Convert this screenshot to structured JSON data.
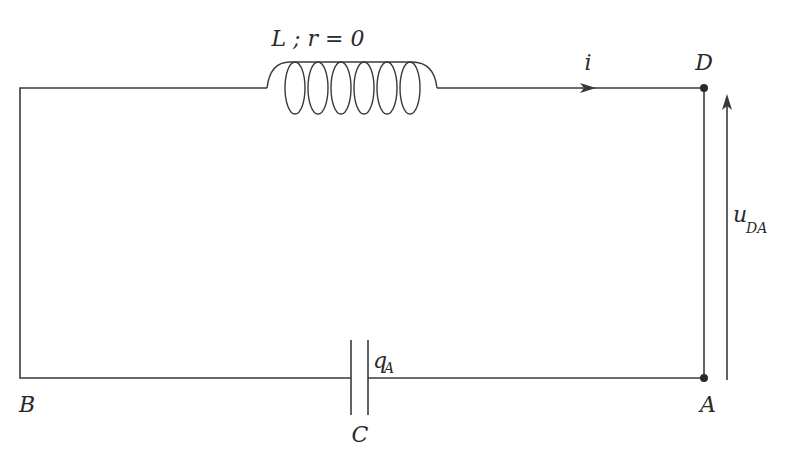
{
  "diagram": {
    "type": "LC circuit schematic",
    "inductor_label": "L ; r = 0",
    "current_label": "i",
    "voltage_label": "u",
    "voltage_subscript": "DA",
    "charge_label": "q",
    "charge_subscript": "A",
    "capacitor_label": "C",
    "nodes": {
      "A": "A",
      "B": "B",
      "D": "D"
    },
    "colors": {
      "line": "#3a3a3a",
      "text": "#2a2a2a",
      "background": "#ffffff"
    }
  }
}
